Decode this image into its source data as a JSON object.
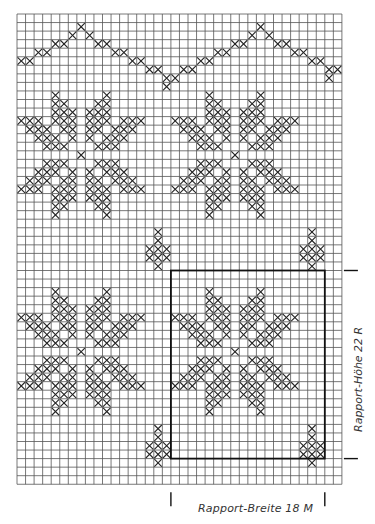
{
  "chart_data": {
    "type": "diagram",
    "grid": {
      "cols": 38,
      "rows": 55,
      "origin_x": 17,
      "origin_y": 14,
      "cell": 8.55
    },
    "colors": {
      "grid": "#555555",
      "cross": "#222222",
      "frame": "#111111",
      "background": "#ffffff"
    },
    "zigzag": [
      [
        5,
        0
      ],
      [
        5,
        1
      ],
      [
        4,
        2
      ],
      [
        4,
        3
      ],
      [
        3,
        4
      ],
      [
        3,
        5
      ],
      [
        2,
        6
      ],
      [
        1,
        7
      ],
      [
        2,
        8
      ],
      [
        3,
        9
      ],
      [
        3,
        10
      ],
      [
        4,
        11
      ],
      [
        4,
        12
      ],
      [
        5,
        13
      ],
      [
        5,
        14
      ],
      [
        6,
        15
      ],
      [
        6,
        16
      ],
      [
        7,
        17
      ],
      [
        8,
        17
      ],
      [
        7,
        18
      ],
      [
        6,
        19
      ],
      [
        6,
        20
      ],
      [
        5,
        21
      ],
      [
        5,
        22
      ],
      [
        4,
        23
      ],
      [
        4,
        24
      ],
      [
        3,
        25
      ],
      [
        3,
        26
      ],
      [
        2,
        27
      ],
      [
        1,
        28
      ],
      [
        2,
        29
      ],
      [
        3,
        30
      ],
      [
        3,
        31
      ],
      [
        4,
        32
      ],
      [
        4,
        33
      ],
      [
        5,
        34
      ],
      [
        5,
        35
      ],
      [
        6,
        36
      ],
      [
        7,
        36
      ],
      [
        6,
        37
      ],
      [
        6,
        38
      ]
    ],
    "star_template": [
      "....X.....X....",
      "....XX...XX....",
      "....XXX.XXX....",
      "XXX.XXX.XXX.XXX",
      ".XXX.XX.XX.XXX.",
      "..XXX.X.X.XXX..",
      "...XXX...XXX...",
      ".......X.......",
      "...XXX...XXX...",
      "..XXX.X.X.XXX..",
      ".XXX.XX.XX.XXX.",
      "XXX.XXX.XXX.XXX",
      "....XXX.XXX....",
      "....XX...XX....",
      "....X.....X...."
    ],
    "stars": [
      {
        "row": 9,
        "col": 0
      },
      {
        "row": 9,
        "col": 18
      },
      {
        "row": 32,
        "col": 0
      },
      {
        "row": 32,
        "col": 18
      }
    ],
    "small_motif_template": [
      ".X.",
      ".X.",
      "XXX",
      "XXX",
      ".X."
    ],
    "small_motifs": [
      {
        "row": 25,
        "col": 15
      },
      {
        "row": 25,
        "col": 33
      },
      {
        "row": 48,
        "col": 15
      },
      {
        "row": 48,
        "col": 33
      }
    ],
    "rapport_box": {
      "col": 18,
      "row": 30,
      "cols": 18,
      "rows": 22
    },
    "labels": {
      "width": "Rapport-Breite 18 M",
      "height": "Rapport-Höhe 22 R"
    }
  }
}
